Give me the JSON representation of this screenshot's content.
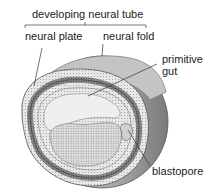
{
  "diagram": {
    "type": "embryo-cross-section",
    "labels": {
      "developing_neural_tube": "developing neural tube",
      "neural_plate": "neural plate",
      "neural_fold": "neural fold",
      "primitive_gut_line1": "primitive",
      "primitive_gut_line2": "gut",
      "blastopore": "blastopore"
    }
  }
}
